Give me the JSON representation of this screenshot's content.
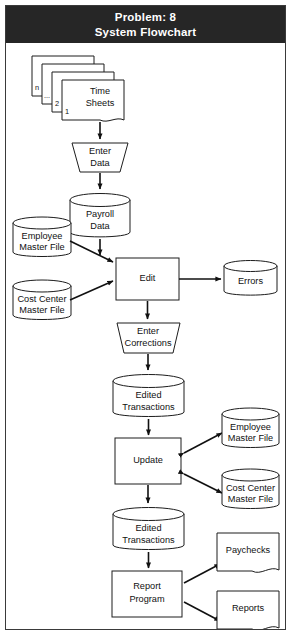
{
  "header": {
    "line1": "Problem: 8",
    "line2": "System Flowchart",
    "background_color": "#262626",
    "text_color": "#ffffff"
  },
  "diagram": {
    "type": "system-flowchart",
    "title": "System Flowchart",
    "problem_number": "8",
    "stroke_color": "#1c1c1c",
    "fill_color": "#ffffff",
    "nodes": [
      {
        "id": "time-sheets",
        "label": "Time Sheets",
        "label_line1": "Time",
        "label_line2": "Sheets",
        "shape": "document-stack",
        "stack_labels": [
          "n",
          "...",
          "2",
          "1"
        ]
      },
      {
        "id": "enter-data",
        "label": "Enter Data",
        "label_line1": "Enter",
        "label_line2": "Data",
        "shape": "manual-operation"
      },
      {
        "id": "payroll-data",
        "label": "Payroll Data",
        "label_line1": "Payroll",
        "label_line2": "Data",
        "shape": "cylinder"
      },
      {
        "id": "employee-master-1",
        "label": "Employee Master File",
        "label_line1": "Employee",
        "label_line2": "Master File",
        "shape": "cylinder"
      },
      {
        "id": "cost-center-1",
        "label": "Cost Center Master File",
        "label_line1": "Cost Center",
        "label_line2": "Master File",
        "shape": "cylinder"
      },
      {
        "id": "edit",
        "label": "Edit",
        "label_line1": "Edit",
        "label_line2": "",
        "shape": "process"
      },
      {
        "id": "errors",
        "label": "Errors",
        "label_line1": "Errors",
        "label_line2": "",
        "shape": "cylinder"
      },
      {
        "id": "enter-corrections",
        "label": "Enter Corrections",
        "label_line1": "Enter",
        "label_line2": "Corrections",
        "shape": "manual-operation"
      },
      {
        "id": "edited-trans-1",
        "label": "Edited Transactions",
        "label_line1": "Edited",
        "label_line2": "Transactions",
        "shape": "cylinder"
      },
      {
        "id": "update",
        "label": "Update",
        "label_line1": "Update",
        "label_line2": "",
        "shape": "process"
      },
      {
        "id": "employee-master-2",
        "label": "Employee Master File",
        "label_line1": "Employee",
        "label_line2": "Master File",
        "shape": "cylinder"
      },
      {
        "id": "cost-center-2",
        "label": "Cost Center Master File",
        "label_line1": "Cost Center",
        "label_line2": "Master File",
        "shape": "cylinder"
      },
      {
        "id": "edited-trans-2",
        "label": "Edited Transactions",
        "label_line1": "Edited",
        "label_line2": "Transactions",
        "shape": "cylinder"
      },
      {
        "id": "report-program",
        "label": "Report Program",
        "label_line1": "Report",
        "label_line2": "Program",
        "shape": "process"
      },
      {
        "id": "paychecks",
        "label": "Paychecks",
        "label_line1": "Paychecks",
        "label_line2": "",
        "shape": "document"
      },
      {
        "id": "reports",
        "label": "Reports",
        "label_line1": "Reports",
        "label_line2": "",
        "shape": "document"
      }
    ],
    "edges": [
      {
        "from": "time-sheets",
        "to": "enter-data",
        "direction": "one-way"
      },
      {
        "from": "enter-data",
        "to": "payroll-data",
        "direction": "one-way"
      },
      {
        "from": "payroll-data",
        "to": "edit",
        "direction": "one-way"
      },
      {
        "from": "employee-master-1",
        "to": "edit",
        "direction": "one-way"
      },
      {
        "from": "cost-center-1",
        "to": "edit",
        "direction": "one-way"
      },
      {
        "from": "edit",
        "to": "errors",
        "direction": "one-way"
      },
      {
        "from": "edit",
        "to": "enter-corrections",
        "direction": "one-way"
      },
      {
        "from": "enter-corrections",
        "to": "edited-trans-1",
        "direction": "one-way"
      },
      {
        "from": "edited-trans-1",
        "to": "update",
        "direction": "one-way"
      },
      {
        "from": "update",
        "to": "employee-master-2",
        "direction": "two-way"
      },
      {
        "from": "update",
        "to": "cost-center-2",
        "direction": "two-way"
      },
      {
        "from": "update",
        "to": "edited-trans-2",
        "direction": "one-way"
      },
      {
        "from": "edited-trans-2",
        "to": "report-program",
        "direction": "one-way"
      },
      {
        "from": "report-program",
        "to": "paychecks",
        "direction": "one-way"
      },
      {
        "from": "report-program",
        "to": "reports",
        "direction": "one-way"
      }
    ]
  }
}
